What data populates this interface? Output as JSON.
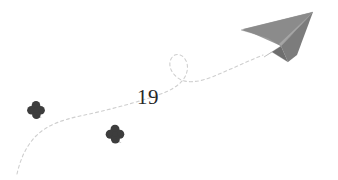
{
  "page": {
    "width": 338,
    "height": 180,
    "background_color": "#ffffff",
    "kind": "book-page-decoration"
  },
  "page_number": {
    "label": "19",
    "color": "#262626"
  },
  "illustration": {
    "title": "Paper airplane with dashed flight trail and clovers",
    "paper_airplane": {
      "name": "paper-airplane",
      "body_color": "#8d8d8d",
      "top_wing_color": "#9a9a9a",
      "shadow_color": "#6f6f6f",
      "fold_color": "#7d7d7d",
      "nose_tip": "313,12",
      "tail": "243,29"
    },
    "flight_trail": {
      "name": "dashed-flight-trail",
      "color": "#c9c9c9",
      "style": "dashed",
      "dash_pattern": "3 3",
      "stroke_width": 1,
      "has_loop": true,
      "loop_center": "181,63",
      "start": "18,172",
      "end": "262,55"
    },
    "clovers": [
      {
        "name": "clover-left",
        "color": "#3d3d3d",
        "cx": 36,
        "cy": 110,
        "size": 17
      },
      {
        "name": "clover-right",
        "color": "#3d3d3d",
        "cx": 115,
        "cy": 134,
        "size": 17
      }
    ]
  }
}
